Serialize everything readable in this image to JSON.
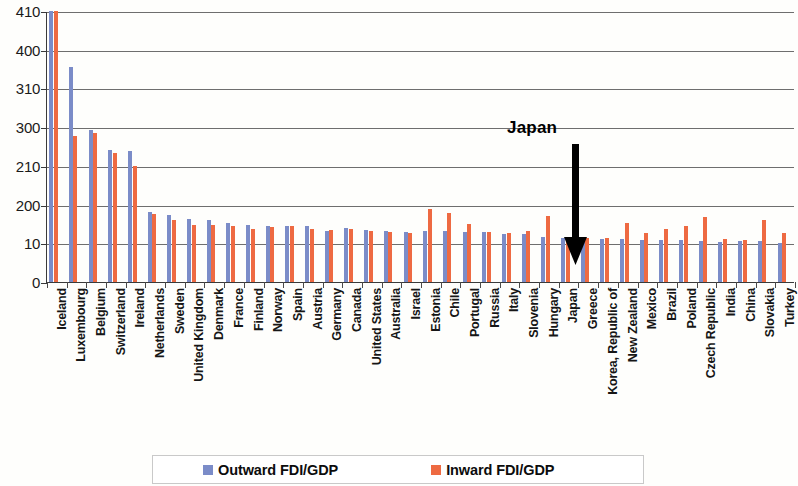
{
  "chart_data": {
    "type": "bar",
    "title": "",
    "xlabel": "",
    "ylabel": "",
    "grid": true,
    "legend_position": "bottom",
    "axis_note": "broken / compressed y-axis",
    "yticks": [
      0,
      10,
      200,
      210,
      300,
      310,
      400,
      410
    ],
    "ylim": [
      0,
      410
    ],
    "categories": [
      "Iceland",
      "Luxembourg",
      "Belgium",
      "Switzerland",
      "Ireland",
      "Netherlands",
      "Sweden",
      "United Kingdom",
      "Denmark",
      "France",
      "Finland",
      "Norway",
      "Spain",
      "Austria",
      "Germany",
      "Canada",
      "United States",
      "Australia",
      "Israel",
      "Estonia",
      "Chile",
      "Portugal",
      "Russia",
      "Italy",
      "Slovenia",
      "Hungary",
      "Japan",
      "Greece",
      "Korea, Republic of",
      "New Zealand",
      "Mexico",
      "Brazil",
      "Poland",
      "Czech Republic",
      "India",
      "China",
      "Slovakia",
      "Turkey"
    ],
    "series": [
      {
        "name": "Outward FDI/GDP",
        "color": "#7b8cc8",
        "values": [
          410,
          360,
          293,
          247,
          245,
          162,
          147,
          130,
          122,
          108,
          100,
          95,
          96,
          94,
          72,
          86,
          75,
          72,
          66,
          68,
          70,
          67,
          64,
          58,
          56,
          42,
          35,
          34,
          32,
          30,
          28,
          27,
          25,
          23,
          18,
          22,
          20,
          12
        ]
      },
      {
        "name": "Inward FDI/GDP",
        "color": "#ee6a42",
        "values": [
          437,
          280,
          287,
          240,
          210,
          155,
          122,
          100,
          99,
          95,
          80,
          92,
          96,
          82,
          76,
          80,
          70,
          65,
          60,
          180,
          157,
          105,
          65,
          60,
          68,
          145,
          22,
          38,
          34,
          110,
          62,
          78,
          96,
          137,
          33,
          24,
          126,
          60
        ]
      }
    ],
    "annotations": [
      {
        "text": "Japan",
        "target_category": "Japan",
        "arrow": "down"
      }
    ]
  },
  "legend": {
    "outward_label": "Outward FDI/GDP",
    "inward_label": "Inward FDI/GDP"
  },
  "annotation": {
    "japan_label": "Japan"
  }
}
